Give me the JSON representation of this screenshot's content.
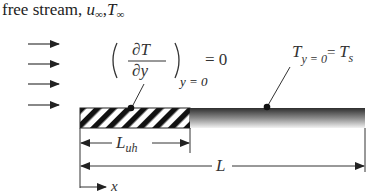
{
  "title": {
    "prefix": "free stream, ",
    "u": "u",
    "u_sub": "∞",
    "sep": ",",
    "T": "T",
    "T_sub": "∞"
  },
  "left_condition": {
    "partial_T": "∂T",
    "partial_y": "∂y",
    "subscript": "y = 0",
    "equals": "= 0"
  },
  "right_condition": {
    "T": "T",
    "T_sub": "y = 0",
    "equals": "= ",
    "Ts": "T",
    "Ts_sub": "s"
  },
  "dimensions": {
    "unheated_length": "L",
    "unheated_sub": "uh",
    "total_length": "L",
    "x_axis": "x"
  },
  "free_stream_arrow_count": 4,
  "colors": {
    "ink": "#222222",
    "hatch": "#111111",
    "plate_dark": "#3a3a3a",
    "plate_light": "#f5f5f5"
  }
}
